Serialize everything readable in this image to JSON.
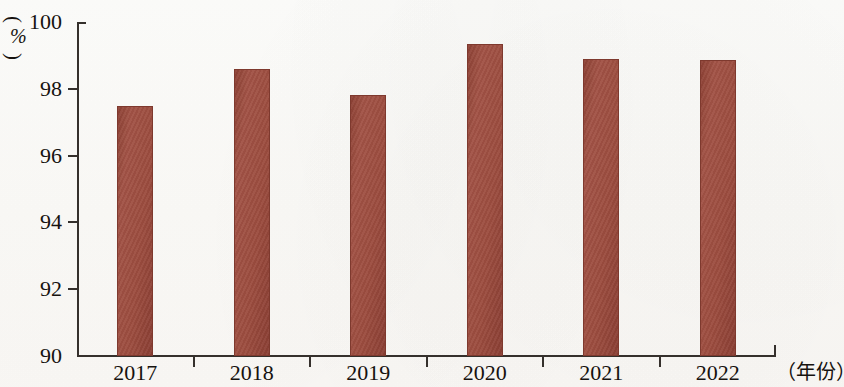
{
  "chart_data": {
    "type": "bar",
    "title": "",
    "subtitle": "",
    "xlabel": "（年份）",
    "ylabel": "（%）",
    "categories": [
      "2017",
      "2018",
      "2019",
      "2020",
      "2021",
      "2022"
    ],
    "values": [
      97.5,
      98.6,
      97.8,
      99.35,
      98.9,
      98.85
    ],
    "series": [
      {
        "name": "",
        "values": [
          97.5,
          98.6,
          97.8,
          99.35,
          98.9,
          98.85
        ]
      }
    ],
    "ylim": [
      90,
      100
    ],
    "y_ticks": [
      "90",
      "92",
      "94",
      "96",
      "98",
      "100"
    ],
    "y_tick_values": [
      90,
      92,
      94,
      96,
      98,
      100
    ],
    "y_tick_interval": 2,
    "x_ticks": [
      "2017",
      "2018",
      "2019",
      "2020",
      "2021",
      "2022"
    ],
    "grid": false,
    "legend": false,
    "legend_position": "none",
    "bar_color": "#9c4c3f",
    "bar_border_color": "#7e392e",
    "axis_color": "#35302c",
    "text_color": "#16120f",
    "background_color": "#fdfcfa",
    "annotations": []
  },
  "axis": {
    "unit_paren_open": "(",
    "unit_paren_close": ")",
    "unit_symbol": "%"
  }
}
